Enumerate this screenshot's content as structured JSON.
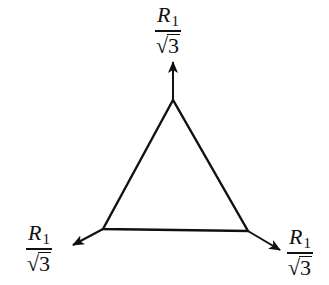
{
  "diagram": {
    "type": "equilateral-triangle-with-outward-arrows",
    "stroke_color": "#111111",
    "background": "#ffffff",
    "triangle": {
      "vertices": {
        "top": [
          173,
          100
        ],
        "left": [
          103,
          229
        ],
        "right": [
          248,
          231
        ]
      }
    },
    "arrows": [
      {
        "id": "top",
        "from": [
          173,
          100
        ],
        "to": [
          173,
          62
        ]
      },
      {
        "id": "left",
        "from": [
          103,
          229
        ],
        "to": [
          73,
          245
        ]
      },
      {
        "id": "right",
        "from": [
          248,
          231
        ],
        "to": [
          280,
          250
        ]
      }
    ],
    "labels": {
      "top": {
        "numerator": "R",
        "subscript": "1",
        "radical": "√",
        "radicand": "3"
      },
      "left": {
        "numerator": "R",
        "subscript": "1",
        "radical": "√",
        "radicand": "3"
      },
      "right": {
        "numerator": "R",
        "subscript": "1",
        "radical": "√",
        "radicand": "3"
      }
    }
  }
}
